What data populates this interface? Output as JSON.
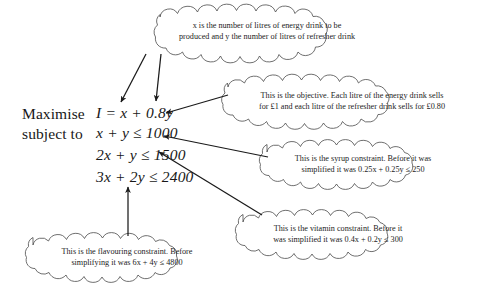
{
  "figure": {
    "type": "annotated-diagram",
    "background_color": "#ffffff",
    "ink_color": "#1a1a1a"
  },
  "problem": {
    "keyword_maximise": "Maximise",
    "keyword_subject_to": "subject to",
    "objective": {
      "lhs": "I",
      "eq": "=",
      "rhs_term1": "x",
      "plus": "+",
      "rhs_term2": "0.8y",
      "full": "I = x + 0.8y"
    },
    "constraints": [
      {
        "full": "x + y ≤ 1000",
        "lhs": "x + y",
        "rel": "≤",
        "rhs": "1000"
      },
      {
        "full": "2x + y ≤ 1500",
        "lhs": "2x + y",
        "rel": "≤",
        "rhs": "1500"
      },
      {
        "full": "3x + 2y ≤ 2400",
        "lhs": "3x + 2y",
        "rel": "≤",
        "rhs": "2400"
      }
    ]
  },
  "annotations": [
    {
      "id": "variables-cloud",
      "name": "variable-definition-annotation",
      "line1": "x is the number of litres of energy drink to be",
      "line2": "produced and y the number of litres of refresher drink",
      "points_to": [
        "x",
        "0.8y"
      ]
    },
    {
      "id": "objective-cloud",
      "name": "objective-annotation",
      "line1": "This is the objective. Each litre of the energy drink sells",
      "line2": "for £1 and each litre of the refresher drink sells for £0.80",
      "points_to": [
        "I = x + 0.8y"
      ]
    },
    {
      "id": "syrup-cloud",
      "name": "syrup-constraint-annotation",
      "line1": "This is the syrup constraint. Before it was",
      "line2": "simplified it was 0.25x + 0.25y ≤ 250",
      "points_to": [
        "x + y ≤ 1000"
      ]
    },
    {
      "id": "vitamin-cloud",
      "name": "vitamin-constraint-annotation",
      "line1": "This is the vitamin constraint. Before it",
      "line2": "was simplified it was 0.4x + 0.2y ≤ 300",
      "points_to": [
        "2x + y ≤ 1500"
      ]
    },
    {
      "id": "flavouring-cloud",
      "name": "flavouring-constraint-annotation",
      "line1": "This is the flavouring constraint. Before",
      "line2": "simplifying it was 6x + 4y ≤ 4800",
      "points_to": [
        "3x + 2y ≤ 2400"
      ]
    }
  ]
}
